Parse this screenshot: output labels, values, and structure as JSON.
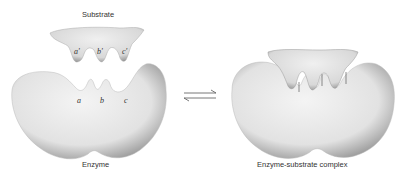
{
  "diagram": {
    "type": "enzyme-substrate binding (lock and key)",
    "labels": {
      "substrate": "Substrate",
      "enzyme": "Enzyme",
      "complex": "Enzyme-substrate complex"
    },
    "substrate_sites": [
      "a'",
      "b'",
      "c'"
    ],
    "enzyme_sites": [
      "a",
      "b",
      "c"
    ],
    "equilibrium_symbol": "⇌"
  },
  "colors": {
    "shape_fill": "#e6e6e6",
    "shape_shadow": "#9a9a9a",
    "text": "#333333"
  }
}
